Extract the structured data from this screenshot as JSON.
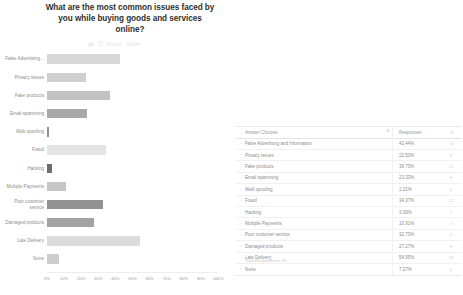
{
  "title": {
    "lines": [
      "What are the most common issues faced by",
      "you while buying goods and services",
      "online?"
    ]
  },
  "mini_toolbar": {
    "icons": [
      "grid-icon",
      "list-icon"
    ],
    "export_label": "Export",
    "share_label": "Share"
  },
  "table": {
    "header": {
      "choices": "Answer Choices",
      "responses": "Responses",
      "sort_glyph": "⇅"
    },
    "footer": "Total Respondents: 33",
    "rows": [
      {
        "label": "False Advertising and Information",
        "percent": "42.44%",
        "count": "14",
        "bullet": "–"
      },
      {
        "label": "Privacy issues",
        "percent": "22.53%",
        "count": "8",
        "bullet": "–"
      },
      {
        "label": "Fake products",
        "percent": "36.73%",
        "count": "12",
        "bullet": "–"
      },
      {
        "label": "Email spamming",
        "percent": "23.33%",
        "count": "8",
        "bullet": "–"
      },
      {
        "label": "Web spoofing",
        "percent": "1.21%",
        "count": "4",
        "bullet": "–"
      },
      {
        "label": "Fraud",
        "percent": "34.37%",
        "count": "12",
        "bullet": "–"
      },
      {
        "label": "Hacking",
        "percent": "3.09%",
        "count": "1",
        "bullet": "–"
      },
      {
        "label": "Multiple Payments",
        "percent": "10.91%",
        "count": "3",
        "bullet": "–"
      },
      {
        "label": "Poor customer service",
        "percent": "32.73%",
        "count": "11",
        "bullet": "–"
      },
      {
        "label": "Damaged products",
        "percent": "27.27%",
        "count": "9",
        "bullet": "–"
      },
      {
        "label": "Late Delivery",
        "percent": "54.55%",
        "count": "18",
        "bullet": "–"
      },
      {
        "label": "None",
        "percent": "7.27%",
        "count": "4",
        "bullet": "•"
      }
    ]
  },
  "chart_data": {
    "type": "bar",
    "orientation": "horizontal",
    "title": "What are the most common issues faced by you while buying goods and services online?",
    "xlabel": "",
    "ylabel": "",
    "xlim": [
      0,
      100
    ],
    "grid": false,
    "xticks": [
      "0%",
      "10%",
      "20%",
      "30%",
      "40%",
      "50%",
      "60%",
      "70%",
      "80%",
      "90%",
      "100%"
    ],
    "categories": [
      "False Advertising...",
      "Privacy issues",
      "Fake products",
      "Email spamming",
      "Web spoofing",
      "Fraud",
      "Hacking",
      "Multiple Payments",
      "Poor customer service",
      "Damaged products",
      "Late Delivery",
      "None"
    ],
    "values": [
      42.44,
      22.53,
      36.73,
      23.33,
      1.21,
      34.37,
      3.09,
      10.91,
      32.73,
      27.27,
      54.55,
      7.27
    ],
    "bar_colors": [
      "#d7d7d7",
      "#cfcfcf",
      "#c2c2c2",
      "#a8a8a8",
      "#8f8f8f",
      "#e4e4e4",
      "#6e6e6e",
      "#c6c6c6",
      "#919191",
      "#a3a3a3",
      "#dcdcdc",
      "#cdcdcd"
    ]
  }
}
